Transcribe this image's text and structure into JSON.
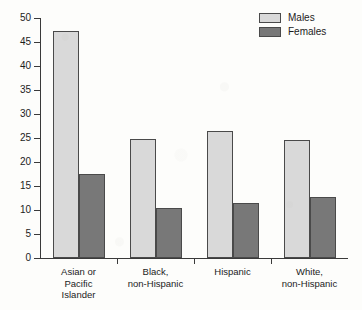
{
  "chart_data": {
    "type": "bar",
    "title": "",
    "xlabel": "",
    "ylabel": "",
    "ylim": [
      0,
      50
    ],
    "yticks": [
      0,
      5,
      10,
      15,
      20,
      25,
      30,
      35,
      40,
      45,
      50
    ],
    "grid": false,
    "legend_position": "top-right",
    "categories": [
      "Asian or\nPacific\nIslander",
      "Black,\nnon-Hispanic",
      "Hispanic",
      "White,\nnon-Hispanic"
    ],
    "series": [
      {
        "name": "Males",
        "color": "#d9d9d9",
        "values": [
          47.2,
          24.7,
          26.5,
          24.6
        ]
      },
      {
        "name": "Females",
        "color": "#787878",
        "values": [
          17.5,
          10.4,
          11.5,
          12.7
        ]
      }
    ]
  },
  "legend": {
    "items": [
      {
        "label": "Males"
      },
      {
        "label": "Females"
      }
    ]
  }
}
